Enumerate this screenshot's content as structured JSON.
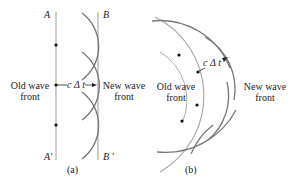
{
  "panel_a": {
    "label_A": "A",
    "label_B": "B",
    "label_A_prime": "A′",
    "label_B_prime": "B ′",
    "old_front_line1": "Old wave",
    "old_front_line2": "front",
    "new_front_line1": "New wave",
    "new_front_line2": "front",
    "distance_label": "c Δ t",
    "caption": "(a)"
  },
  "panel_b": {
    "old_front_line1": "Old wave",
    "old_front_line2": "front",
    "new_front_line1": "New wave",
    "new_front_line2": "front",
    "distance_label": "c Δ t",
    "caption": "(b)"
  },
  "colors": {
    "line": "#999999",
    "arc": "#777777",
    "dot": "#111111"
  }
}
